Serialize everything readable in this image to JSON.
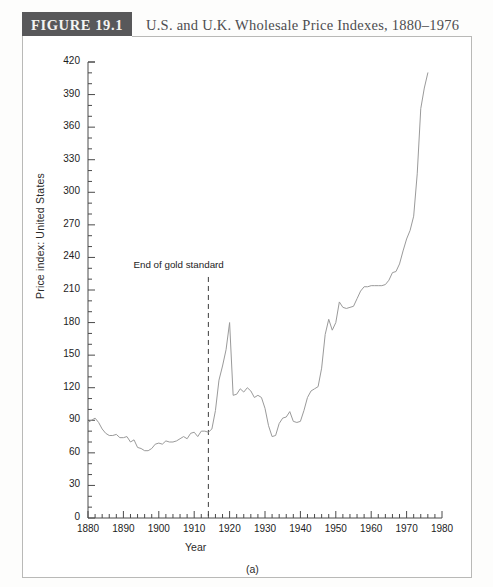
{
  "figure": {
    "badge": "FIGURE 19.1",
    "title": "U.S. and U.K. Wholesale Price Indexes, 1880–1976",
    "panel_caption": "(a)"
  },
  "chart_data": {
    "type": "line",
    "title": "U.S. and U.K. Wholesale Price Indexes, 1880–1976",
    "xlabel": "Year",
    "ylabel": "Price index: United States",
    "xlim": [
      1880,
      1980
    ],
    "ylim": [
      0,
      420
    ],
    "xticks": [
      1880,
      1890,
      1900,
      1910,
      1920,
      1930,
      1940,
      1950,
      1960,
      1970,
      1980
    ],
    "xtick_labels": [
      "1880",
      "1890",
      "1900",
      "1910",
      "1920",
      "1930",
      "1940",
      "1950",
      "1960",
      "1970",
      "1980"
    ],
    "x_minor_tick_step": 2,
    "yticks": [
      0,
      30,
      60,
      90,
      120,
      150,
      180,
      210,
      240,
      270,
      300,
      330,
      360,
      390,
      420
    ],
    "ytick_labels": [
      "0",
      "30",
      "60",
      "90",
      "120",
      "150",
      "180",
      "210",
      "240",
      "270",
      "300",
      "330",
      "360",
      "390",
      "420"
    ],
    "y_minor_tick_step": 10,
    "grid": false,
    "legend": null,
    "line_color": "#9a9a9a",
    "annotations": [
      {
        "text": "End of gold standard",
        "x": 1914,
        "type": "vline-dashed",
        "label_x": 1903,
        "label_y": 232,
        "line_top_y": 222,
        "line_bottom_y": 0,
        "color": "#3c3c3c"
      }
    ],
    "series": [
      {
        "name": "Price index: United States",
        "x": [
          1880,
          1881,
          1882,
          1883,
          1884,
          1885,
          1886,
          1887,
          1888,
          1889,
          1890,
          1891,
          1892,
          1893,
          1894,
          1895,
          1896,
          1897,
          1898,
          1899,
          1900,
          1901,
          1902,
          1903,
          1904,
          1905,
          1906,
          1907,
          1908,
          1909,
          1910,
          1911,
          1912,
          1913,
          1914,
          1915,
          1916,
          1917,
          1918,
          1919,
          1920,
          1921,
          1922,
          1923,
          1924,
          1925,
          1926,
          1927,
          1928,
          1929,
          1930,
          1931,
          1932,
          1933,
          1934,
          1935,
          1936,
          1937,
          1938,
          1939,
          1940,
          1941,
          1942,
          1943,
          1944,
          1945,
          1946,
          1947,
          1948,
          1949,
          1950,
          1951,
          1952,
          1953,
          1954,
          1955,
          1956,
          1957,
          1958,
          1959,
          1960,
          1961,
          1962,
          1963,
          1964,
          1965,
          1966,
          1967,
          1968,
          1969,
          1970,
          1971,
          1972,
          1973,
          1974,
          1975,
          1976
        ],
        "y": [
          88,
          90,
          92,
          88,
          82,
          78,
          76,
          76,
          77,
          74,
          74,
          75,
          70,
          72,
          65,
          64,
          62,
          62,
          64,
          68,
          69,
          68,
          71,
          70,
          70,
          71,
          73,
          75,
          73,
          78,
          79,
          75,
          80,
          80,
          79,
          82,
          99,
          127,
          140,
          155,
          180,
          113,
          114,
          119,
          116,
          120,
          117,
          111,
          113,
          111,
          101,
          85,
          75,
          76,
          87,
          92,
          93,
          98,
          89,
          88,
          89,
          99,
          111,
          117,
          119,
          121,
          138,
          169,
          183,
          173,
          180,
          199,
          194,
          193,
          194,
          195,
          202,
          209,
          213,
          213,
          214,
          214,
          214,
          214,
          215,
          219,
          226,
          227,
          234,
          246,
          257,
          265,
          278,
          317,
          377,
          396,
          410
        ],
        "color": "#9a9a9a",
        "linewidth": 1
      }
    ]
  }
}
